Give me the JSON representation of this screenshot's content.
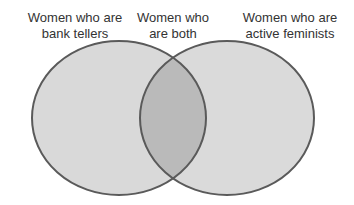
{
  "diagram": {
    "type": "venn",
    "sets": [
      {
        "id": "left",
        "label_lines": [
          "Women who are",
          "bank tellers"
        ]
      },
      {
        "id": "right",
        "label_lines": [
          "Women who are",
          "active feminists"
        ]
      }
    ],
    "intersection": {
      "label_lines": [
        "Women who",
        "are both"
      ]
    },
    "colors": {
      "fill": "#d8d8d8",
      "overlap": "#b9b9b9",
      "stroke": "#555555",
      "text": "#333333"
    }
  }
}
